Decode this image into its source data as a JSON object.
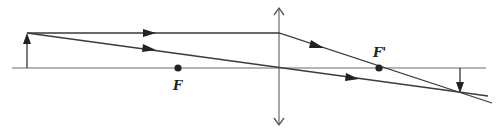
{
  "diagram": {
    "colors": {
      "line": "#3a3a3a",
      "axis": "#6a6a6a",
      "background": "#ffffff"
    },
    "axis": {
      "x1": 12,
      "x2": 486,
      "y": 68
    },
    "lens": {
      "x": 279,
      "y_top": 8,
      "y_bottom": 125,
      "type": "converging"
    },
    "object": {
      "x": 27,
      "y_base": 68,
      "y_tip": 33
    },
    "image": {
      "x": 460,
      "y_base": 68,
      "y_tip": 92
    },
    "focal_points": [
      {
        "name": "F",
        "label": "F",
        "x": 178,
        "y": 68,
        "label_x": 173,
        "label_y": 79
      },
      {
        "name": "F-prime",
        "label": "F'",
        "x": 379,
        "y": 68,
        "label_x": 373,
        "label_y": 46
      }
    ],
    "rays": [
      {
        "name": "parallel-ray",
        "points": [
          [
            27,
            33
          ],
          [
            279,
            33
          ],
          [
            492,
            103
          ]
        ],
        "arrows": [
          [
            150,
            33
          ],
          [
            318,
            46
          ]
        ]
      },
      {
        "name": "center-ray",
        "points": [
          [
            27,
            33
          ],
          [
            488,
            96
          ]
        ],
        "arrows": [
          [
            150,
            49
          ],
          [
            353,
            78
          ]
        ]
      }
    ]
  }
}
